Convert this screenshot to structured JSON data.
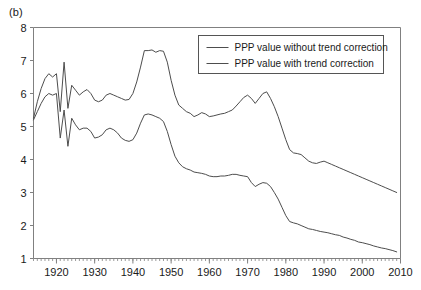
{
  "panel": {
    "label": "(b)"
  },
  "chart_data": {
    "type": "line",
    "title": "",
    "subtitle": "",
    "xlabel": "",
    "ylabel": "",
    "xlim": [
      1914,
      2010
    ],
    "ylim": [
      1,
      8
    ],
    "grid": false,
    "legend_position": "top-right",
    "yticks": [
      1,
      2,
      3,
      4,
      5,
      6,
      7,
      8
    ],
    "ytick_labels": [
      "1",
      "2",
      "3",
      "4",
      "5",
      "6",
      "7",
      "8"
    ],
    "xticks": [
      1920,
      1930,
      1940,
      1950,
      1960,
      1970,
      1980,
      1990,
      2000,
      2010
    ],
    "xtick_labels": [
      "1920",
      "1930",
      "1940",
      "1950",
      "1960",
      "1970",
      "1980",
      "1990",
      "2000",
      "2010"
    ],
    "xminor_tick_interval": 1,
    "line_color": "#4d4d4d",
    "frame_color": "#808080",
    "x": [
      1914,
      1915,
      1916,
      1917,
      1918,
      1919,
      1920,
      1921,
      1922,
      1923,
      1924,
      1925,
      1926,
      1927,
      1928,
      1929,
      1930,
      1931,
      1932,
      1933,
      1934,
      1935,
      1936,
      1937,
      1938,
      1939,
      1940,
      1941,
      1942,
      1943,
      1944,
      1945,
      1946,
      1947,
      1948,
      1949,
      1950,
      1951,
      1952,
      1953,
      1954,
      1955,
      1956,
      1957,
      1958,
      1959,
      1960,
      1961,
      1962,
      1963,
      1964,
      1965,
      1966,
      1967,
      1968,
      1969,
      1970,
      1971,
      1972,
      1973,
      1974,
      1975,
      1976,
      1977,
      1978,
      1979,
      1980,
      1981,
      1982,
      1983,
      1984,
      1985,
      1986,
      1987,
      1988,
      1989,
      1990,
      1991,
      1992,
      1993,
      1994,
      1995,
      1996,
      1997,
      1998,
      1999,
      2000,
      2001,
      2002,
      2003,
      2004,
      2005,
      2006,
      2007,
      2008,
      2009
    ],
    "series": [
      {
        "name": "PPP value without trend correction",
        "values": [
          5.25,
          5.75,
          6.15,
          6.45,
          6.6,
          6.5,
          6.6,
          5.45,
          6.95,
          5.55,
          6.25,
          6.1,
          5.95,
          6.05,
          6.12,
          6.0,
          5.8,
          5.75,
          5.8,
          5.95,
          6.0,
          5.95,
          5.9,
          5.85,
          5.8,
          5.82,
          6.0,
          6.35,
          6.8,
          7.3,
          7.3,
          7.32,
          7.25,
          7.3,
          7.28,
          6.95,
          6.4,
          5.95,
          5.65,
          5.55,
          5.45,
          5.4,
          5.3,
          5.35,
          5.42,
          5.38,
          5.3,
          5.32,
          5.35,
          5.38,
          5.4,
          5.45,
          5.5,
          5.62,
          5.75,
          5.88,
          5.95,
          5.85,
          5.7,
          5.85,
          6.0,
          6.05,
          5.85,
          5.6,
          5.3,
          4.95,
          4.6,
          4.3,
          4.2,
          4.18,
          4.15,
          4.05,
          3.95,
          3.9,
          3.88,
          3.92,
          3.95,
          3.9,
          3.85,
          3.8,
          3.75,
          3.7,
          3.65,
          3.6,
          3.55,
          3.5,
          3.45,
          3.4,
          3.35,
          3.3,
          3.25,
          3.2,
          3.15,
          3.1,
          3.05,
          3.0
        ]
      },
      {
        "name": "PPP value with trend correction",
        "values": [
          5.2,
          5.45,
          5.7,
          5.9,
          6.0,
          5.95,
          6.0,
          4.65,
          5.5,
          4.4,
          5.25,
          5.05,
          4.9,
          4.95,
          4.95,
          4.85,
          4.65,
          4.68,
          4.75,
          4.9,
          4.95,
          4.9,
          4.8,
          4.65,
          4.58,
          4.55,
          4.6,
          4.8,
          5.1,
          5.35,
          5.38,
          5.35,
          5.3,
          5.25,
          5.15,
          4.85,
          4.45,
          4.1,
          3.9,
          3.78,
          3.72,
          3.68,
          3.62,
          3.6,
          3.58,
          3.55,
          3.5,
          3.48,
          3.48,
          3.5,
          3.5,
          3.52,
          3.55,
          3.55,
          3.52,
          3.5,
          3.48,
          3.3,
          3.18,
          3.25,
          3.3,
          3.28,
          3.18,
          3.0,
          2.8,
          2.55,
          2.3,
          2.12,
          2.08,
          2.05,
          2.0,
          1.95,
          1.9,
          1.88,
          1.85,
          1.82,
          1.8,
          1.78,
          1.75,
          1.72,
          1.7,
          1.65,
          1.62,
          1.58,
          1.55,
          1.5,
          1.48,
          1.45,
          1.42,
          1.38,
          1.35,
          1.32,
          1.3,
          1.27,
          1.24,
          1.2
        ]
      }
    ]
  },
  "legend": {
    "items": [
      {
        "label": "PPP value without trend correction"
      },
      {
        "label": "PPP value with trend correction"
      }
    ]
  }
}
